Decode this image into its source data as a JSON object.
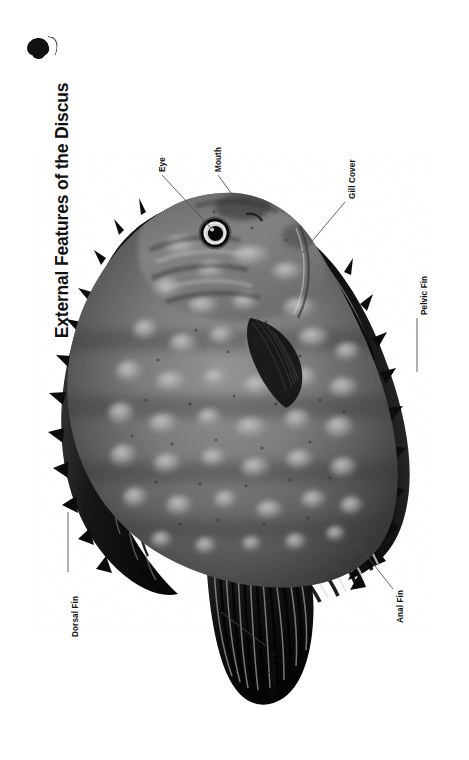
{
  "page": {
    "title": "External Features of the Discus",
    "background_color": "#ffffff",
    "text_color": "#111111",
    "orientation": "rotated-90",
    "width": 469,
    "height": 760
  },
  "logo": {
    "name": "fish-silhouette-mark",
    "color": "#111111"
  },
  "diagram": {
    "image_style": "grayscale photograph",
    "labels": [
      {
        "id": "eye",
        "text": "Eye"
      },
      {
        "id": "mouth",
        "text": "Mouth"
      },
      {
        "id": "gill-cover",
        "text": "Gill Cover"
      },
      {
        "id": "pelvic-fin",
        "text": "Pelvic Fin"
      },
      {
        "id": "dorsal-fin",
        "text": "Dorsal Fin"
      },
      {
        "id": "caudal-fin",
        "text": "Caudal Fin"
      },
      {
        "id": "anal-fin",
        "text": "Anal Fin"
      }
    ]
  }
}
